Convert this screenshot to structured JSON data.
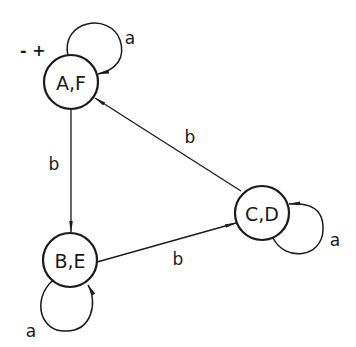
{
  "diagram": {
    "type": "state-transition-diagram",
    "colors": {
      "stroke": "#1a1a1a",
      "background": "#ffffff"
    },
    "start_marker": {
      "label": "- +",
      "node": "AF"
    },
    "nodes": [
      {
        "id": "AF",
        "label": "A,F",
        "cx": 71,
        "cy": 82,
        "r": 27
      },
      {
        "id": "BE",
        "label": "B,E",
        "cx": 70,
        "cy": 260,
        "r": 27
      },
      {
        "id": "CD",
        "label": "C,D",
        "cx": 262,
        "cy": 213,
        "r": 27
      }
    ],
    "edges": [
      {
        "from": "AF",
        "to": "AF",
        "label": "a",
        "kind": "self-loop"
      },
      {
        "from": "AF",
        "to": "BE",
        "label": "b",
        "kind": "straight"
      },
      {
        "from": "BE",
        "to": "BE",
        "label": "a",
        "kind": "self-loop"
      },
      {
        "from": "BE",
        "to": "CD",
        "label": "b",
        "kind": "straight"
      },
      {
        "from": "CD",
        "to": "CD",
        "label": "a",
        "kind": "self-loop"
      },
      {
        "from": "CD",
        "to": "AF",
        "label": "b",
        "kind": "straight"
      }
    ]
  }
}
